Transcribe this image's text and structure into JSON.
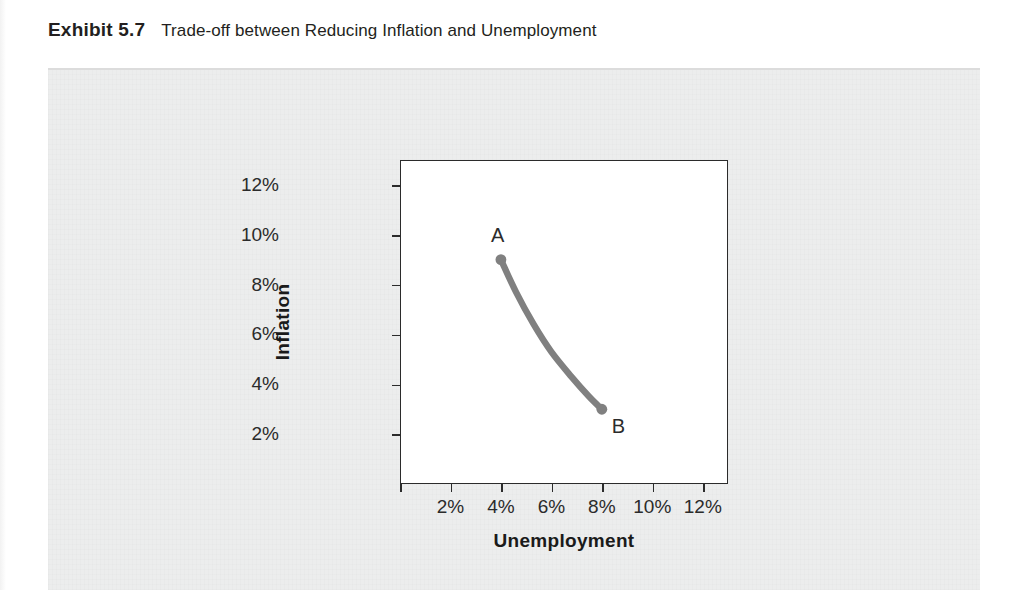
{
  "caption": {
    "label": "Exhibit 5.7",
    "text": "Trade-off between Reducing Inflation and Unemployment"
  },
  "chart_data": {
    "type": "line",
    "title": "Trade-off between Reducing Inflation and Unemployment",
    "xlabel": "Unemployment",
    "ylabel": "Inflation",
    "xlim": [
      0,
      13
    ],
    "ylim": [
      0,
      13
    ],
    "grid": false,
    "legend": "none",
    "x_ticks": [
      "2%",
      "4%",
      "6%",
      "8%",
      "10%",
      "12%"
    ],
    "x_tick_values": [
      2,
      4,
      6,
      8,
      10,
      12
    ],
    "y_ticks": [
      "2%",
      "4%",
      "6%",
      "8%",
      "10%",
      "12%"
    ],
    "y_tick_values": [
      2,
      4,
      6,
      8,
      10,
      12
    ],
    "series": [
      {
        "name": "Phillips curve",
        "color": "#808080",
        "x": [
          4,
          4.6,
          5.3,
          6.0,
          6.8,
          7.5,
          8
        ],
        "y": [
          9.0,
          7.7,
          6.4,
          5.3,
          4.3,
          3.5,
          3.0
        ]
      }
    ],
    "annotations": [
      {
        "label": "A",
        "x": 4,
        "y": 9,
        "marker": true,
        "position": "above-left"
      },
      {
        "label": "B",
        "x": 8,
        "y": 3,
        "marker": true,
        "position": "below-right"
      }
    ]
  },
  "colors": {
    "curve": "#808080",
    "panel": "#eceded",
    "frame": "#2b2b2b",
    "text": "#231f20"
  }
}
